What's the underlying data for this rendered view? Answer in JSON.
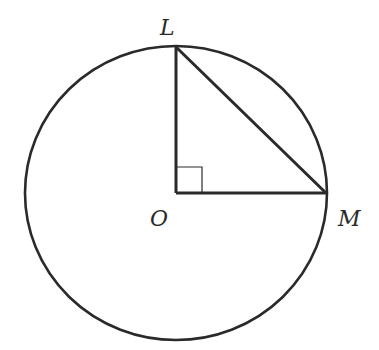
{
  "diagram": {
    "points": {
      "L": {
        "label": "L",
        "x": 176,
        "y": 47
      },
      "O": {
        "label": "O",
        "x": 176,
        "y": 193
      },
      "M": {
        "label": "M",
        "x": 326,
        "y": 193
      }
    },
    "circle": {
      "cx": 176,
      "cy": 193,
      "rx": 151,
      "ry": 147,
      "center_label": "O"
    },
    "segments": [
      {
        "from": "O",
        "to": "L"
      },
      {
        "from": "O",
        "to": "M"
      },
      {
        "from": "L",
        "to": "M"
      }
    ],
    "right_angle_marker": {
      "at": "O",
      "size": 26
    },
    "colors": {
      "stroke": "#2a2a2a",
      "background": "#ffffff"
    }
  }
}
